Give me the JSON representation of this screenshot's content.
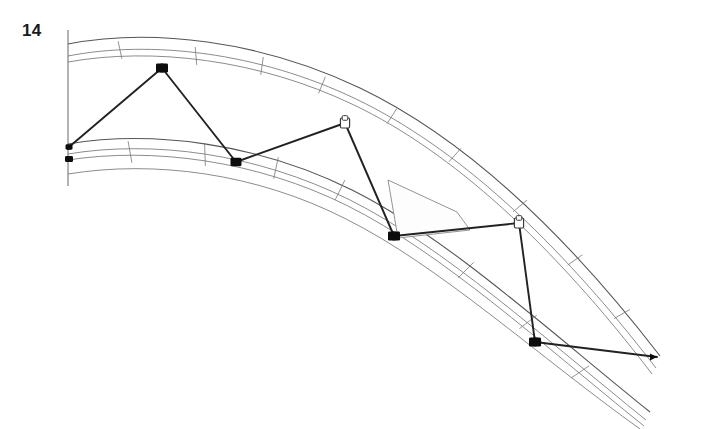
{
  "figure": {
    "number": "14"
  },
  "colors": {
    "background": "#ffffff",
    "line_thin": "#555555",
    "line_hairline": "#777777",
    "line_diagonal": "#222222",
    "node_solid": "#0d0d0d",
    "node_outline": "#3a3a3a",
    "plate_fill": "#fdfdfd",
    "plate_stroke": "#888888",
    "cut_line": "#666666",
    "label_text": "#1a1a1a"
  },
  "drawing": {
    "viewbox": "0 0 712 429",
    "cut_line": {
      "x": 68,
      "y1": 30,
      "y2": 186,
      "label": "section-cut-line"
    },
    "upper_chord": {
      "label": "upper-chord",
      "lines": [
        "M 68,44 C 150,28 260,40 360,88 C 460,136 560,226 660,356",
        "M 68,56 C 150,40 258,52 356,99 C 456,147 556,238 656,368",
        "M 68,62 C 152,47 258,59 354,105 C 452,152 552,243 652,374"
      ],
      "ticks": [
        {
          "x": 120,
          "y": 50,
          "angle": -12
        },
        {
          "x": 196,
          "y": 56,
          "angle": -5
        },
        {
          "x": 262,
          "y": 66,
          "angle": 8
        },
        {
          "x": 322,
          "y": 85,
          "angle": 22
        },
        {
          "x": 392,
          "y": 116,
          "angle": 33
        },
        {
          "x": 455,
          "y": 155,
          "angle": 42
        },
        {
          "x": 520,
          "y": 206,
          "angle": 50
        },
        {
          "x": 575,
          "y": 260,
          "angle": 55
        },
        {
          "x": 622,
          "y": 314,
          "angle": 60
        }
      ]
    },
    "lower_chord": {
      "label": "lower-chord",
      "lines": [
        "M 68,144 C 152,130 258,143 352,190 C 448,238 548,330 650,412",
        "M 68,154 C 152,140 256,153 350,200 C 444,247 544,338 646,420",
        "M 68,160 C 152,147 256,160 348,206 C 442,253 542,344 644,426",
        "M 68,174 C 154,160 256,173 346,219 C 440,266 538,356 640,429"
      ],
      "ticks": [
        {
          "x": 130,
          "y": 152,
          "angle": -10
        },
        {
          "x": 205,
          "y": 155,
          "angle": -2
        },
        {
          "x": 276,
          "y": 168,
          "angle": 12
        },
        {
          "x": 340,
          "y": 190,
          "angle": 26
        },
        {
          "x": 404,
          "y": 225,
          "angle": 38
        },
        {
          "x": 466,
          "y": 270,
          "angle": 45
        },
        {
          "x": 528,
          "y": 322,
          "angle": 52
        },
        {
          "x": 580,
          "y": 372,
          "angle": 56
        }
      ]
    },
    "nodes": [
      {
        "id": "n1",
        "name": "node-left-lower",
        "x": 69,
        "y": 147,
        "style": "solid",
        "size": 7
      },
      {
        "id": "n2",
        "name": "node-left-lower-b",
        "x": 69,
        "y": 159,
        "style": "solid",
        "size": 8
      },
      {
        "id": "n3",
        "name": "node-upper-1",
        "x": 162,
        "y": 68,
        "style": "solid",
        "size": 12
      },
      {
        "id": "n4",
        "name": "node-lower-1",
        "x": 236,
        "y": 162,
        "style": "solid",
        "size": 11
      },
      {
        "id": "n5",
        "name": "node-upper-2",
        "x": 345,
        "y": 123,
        "style": "outline",
        "size": 11
      },
      {
        "id": "n6",
        "name": "node-lower-2",
        "x": 394,
        "y": 236,
        "style": "solid",
        "size": 12
      },
      {
        "id": "n7",
        "name": "node-upper-3",
        "x": 519,
        "y": 223,
        "style": "outline",
        "size": 11
      },
      {
        "id": "n8",
        "name": "node-lower-3",
        "x": 535,
        "y": 342,
        "style": "solid",
        "size": 12
      },
      {
        "id": "n9",
        "name": "node-right-end",
        "x": 657,
        "y": 357,
        "style": "arrow",
        "size": 7
      }
    ],
    "diagonals": [
      {
        "name": "diagonal-1",
        "from": [
          69,
          147
        ],
        "to": [
          162,
          68
        ]
      },
      {
        "name": "diagonal-2",
        "from": [
          162,
          68
        ],
        "to": [
          236,
          162
        ]
      },
      {
        "name": "diagonal-3",
        "from": [
          236,
          162
        ],
        "to": [
          345,
          123
        ]
      },
      {
        "name": "diagonal-4",
        "from": [
          345,
          123
        ],
        "to": [
          394,
          236
        ]
      },
      {
        "name": "diagonal-5",
        "from": [
          394,
          236
        ],
        "to": [
          519,
          223
        ]
      },
      {
        "name": "diagonal-6",
        "from": [
          519,
          223
        ],
        "to": [
          535,
          342
        ]
      },
      {
        "name": "diagonal-7",
        "from": [
          535,
          342
        ],
        "to": [
          657,
          357
        ]
      }
    ],
    "gusset_plate": {
      "name": "gusset-plate-quadrilateral",
      "points": "388,180 457,212 470,230 398,238"
    }
  }
}
